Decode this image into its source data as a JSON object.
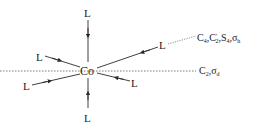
{
  "diagram": {
    "center": {
      "label": "Co"
    },
    "ligands": [
      {
        "id": "top",
        "label": "L"
      },
      {
        "id": "bottom",
        "label": "L"
      },
      {
        "id": "upper-left",
        "label": "L"
      },
      {
        "id": "lower-left",
        "label": "L"
      },
      {
        "id": "upper-right",
        "label": "L"
      },
      {
        "id": "lower-right",
        "label": "L"
      }
    ],
    "axes": [
      {
        "id": "c4-axis",
        "label_parts": [
          "C",
          "4",
          ",C",
          "′",
          "2",
          ",S",
          "4",
          ",σ",
          "h"
        ]
      },
      {
        "id": "c2-axis",
        "label_parts": [
          "C",
          "2",
          ",σ",
          "d"
        ]
      }
    ],
    "colors": {
      "stroke": "#2a2a2a",
      "dotted": "#555555"
    }
  }
}
